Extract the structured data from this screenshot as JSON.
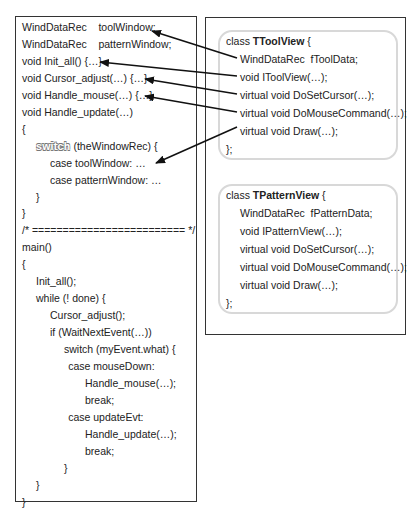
{
  "left_code": {
    "lines": [
      {
        "indent": 0,
        "text": "WindDataRec    toolWindow;"
      },
      {
        "indent": 0,
        "text": "WindDataRec    patternWindow;"
      },
      {
        "indent": 0,
        "text": "void Init_all() {…}"
      },
      {
        "indent": 0,
        "text": "void Cursor_adjust(…) {…}"
      },
      {
        "indent": 0,
        "text": "void Handle_mouse(…) {…}"
      },
      {
        "indent": 0,
        "text": "void Handle_update(…)"
      },
      {
        "indent": 0,
        "text": "{"
      },
      {
        "indent": 1,
        "keyword": "switch",
        "text": " (theWindowRec) {"
      },
      {
        "indent": 2,
        "text": "case toolWindow: …"
      },
      {
        "indent": 2,
        "text": "case patternWindow: …"
      },
      {
        "indent": 1,
        "text": "}"
      },
      {
        "indent": 0,
        "text": "}"
      },
      {
        "indent": 0,
        "text": "/* ========================= */"
      },
      {
        "indent": 0,
        "text": "main()"
      },
      {
        "indent": 0,
        "text": "{"
      },
      {
        "indent": 1,
        "text": "Init_all();"
      },
      {
        "indent": 1,
        "text": "while (! done) {"
      },
      {
        "indent": 2,
        "text": "Cursor_adjust();"
      },
      {
        "indent": 2,
        "text": "if (WaitNextEvent(…))"
      },
      {
        "indent": 3,
        "text": "switch (myEvent.what) {"
      },
      {
        "indent": 3.3,
        "text": "case mouseDown:"
      },
      {
        "indent": 4.5,
        "text": "Handle_mouse(…);"
      },
      {
        "indent": 4.5,
        "text": "break;"
      },
      {
        "indent": 3.3,
        "text": "case updateEvt:"
      },
      {
        "indent": 4.5,
        "text": "Handle_update(…);"
      },
      {
        "indent": 4.5,
        "text": "break;"
      },
      {
        "indent": 3,
        "text": "}"
      },
      {
        "indent": 1,
        "text": "}"
      },
      {
        "indent": 0,
        "text": "}"
      }
    ]
  },
  "classes": [
    {
      "prefix": "class ",
      "name": "TToolView",
      "open": " {",
      "members": [
        "WindDataRec  fToolData;",
        "void IToolView(…);",
        "virtual void DoSetCursor(…);",
        "virtual void DoMouseCommand(…);",
        "virtual void Draw(…);"
      ],
      "close": "};"
    },
    {
      "prefix": "class ",
      "name": "TPatternView",
      "open": " {",
      "members": [
        "WindDataRec  fPatternData;",
        "void IPatternView(…);",
        "virtual void DoSetCursor(…);",
        "virtual void DoMouseCommand(…);",
        "virtual void Draw(…);"
      ],
      "close": "};"
    }
  ],
  "arrows": [
    {
      "from": "TToolView.fToolData",
      "to": "toolWindow"
    },
    {
      "from": "TToolView.IToolView",
      "to": "Init_all"
    },
    {
      "from": "TToolView.DoSetCursor",
      "to": "Cursor_adjust"
    },
    {
      "from": "TToolView.DoMouseCommand",
      "to": "Handle_mouse"
    },
    {
      "from": "TToolView.Draw",
      "to": "case toolWindow"
    }
  ],
  "colors": {
    "border": "#333333",
    "class_box_border": "#d8d8d8",
    "text": "#222222",
    "arrow": "#111111"
  }
}
